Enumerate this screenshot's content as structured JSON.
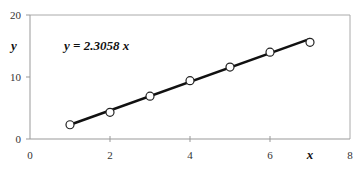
{
  "chart_data": {
    "type": "scatter",
    "title": "",
    "xlabel": "x",
    "ylabel": "y",
    "xlim": [
      0,
      8
    ],
    "ylim": [
      0,
      20
    ],
    "x_ticks": [
      0,
      2,
      4,
      6,
      8
    ],
    "y_ticks": [
      0,
      10,
      20
    ],
    "grid": false,
    "legend": null,
    "series": [
      {
        "name": "data",
        "marker": "open-circle",
        "x": [
          1,
          2,
          3,
          4,
          5,
          6,
          7
        ],
        "y": [
          2.3,
          4.3,
          6.9,
          9.4,
          11.6,
          14.0,
          15.6
        ]
      },
      {
        "name": "fit",
        "type": "line",
        "slope": 2.3058,
        "x_range": [
          1,
          7
        ]
      }
    ],
    "annotations": [
      {
        "text": "y = 2.3058 x",
        "x": 1.4,
        "y": 16.3
      }
    ]
  },
  "labels": {
    "equation": "y = 2.3058 x",
    "xlabel": "x",
    "ylabel": "y",
    "x_ticks": [
      "0",
      "2",
      "4",
      "6",
      "8"
    ],
    "y_ticks": [
      "0",
      "10",
      "20"
    ]
  },
  "colors": {
    "axis": "#999999",
    "line": "#111111",
    "marker": "#222222"
  }
}
